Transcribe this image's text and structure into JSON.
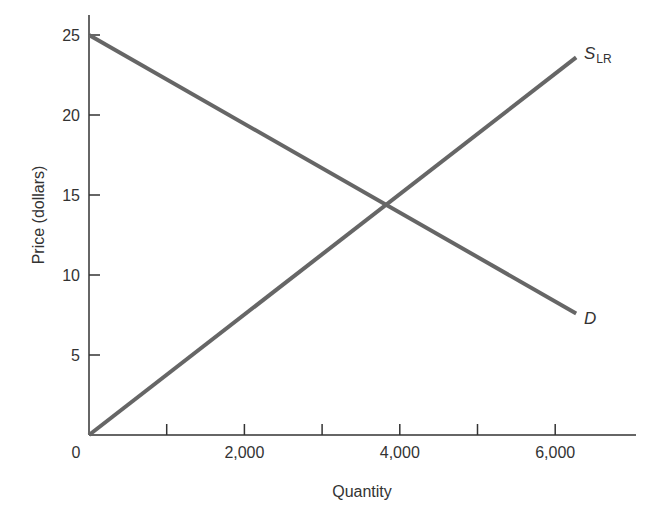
{
  "chart_data": {
    "type": "line",
    "title": "",
    "xlabel": "Quantity",
    "ylabel": "Price (dollars)",
    "xlim": [
      0,
      7000
    ],
    "ylim": [
      0,
      26
    ],
    "x_ticks": [
      1000,
      2000,
      3000,
      4000,
      5000,
      6000
    ],
    "x_tick_labels": [
      "0",
      "2,000",
      "4,000",
      "6,000"
    ],
    "x_tick_label_values": [
      0,
      2000,
      4000,
      6000
    ],
    "y_ticks": [
      5,
      10,
      15,
      20,
      25
    ],
    "y_tick_labels": [
      "5",
      "10",
      "15",
      "20",
      "25"
    ],
    "grid": false,
    "legend": "none (inline curve labels)",
    "series": [
      {
        "name": "S_LR",
        "label_main": "S",
        "label_sub": "LR",
        "description": "Long-run supply",
        "points": [
          [
            0,
            0
          ],
          [
            6270,
            23.6
          ]
        ]
      },
      {
        "name": "D",
        "label_main": "D",
        "label_sub": "",
        "description": "Demand",
        "points": [
          [
            0,
            25
          ],
          [
            6270,
            7.6
          ]
        ]
      }
    ],
    "annotations": [
      {
        "type": "intersection",
        "x": 3820,
        "y": 14.4
      }
    ]
  },
  "colors": {
    "curve": "#666666",
    "axis": "#333333",
    "text": "#333333"
  }
}
